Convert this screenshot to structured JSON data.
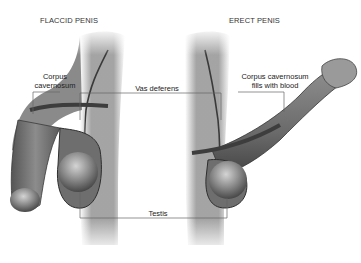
{
  "titles": {
    "left": "FLACCID PENIS",
    "right": "ERECT PENIS"
  },
  "labels": {
    "corpus_left_line1": "Corpus",
    "corpus_left_line2": "cavernosum",
    "vas_deferens": "Vas deferens",
    "corpus_right_line1": "Corpus cavernosum",
    "corpus_right_line2": "fills with blood",
    "testis": "Testis"
  },
  "colors": {
    "tissue": "#7a7a7a",
    "tissue_dark": "#4a4a4a",
    "body_fade": "#9a9a9a",
    "leader_line": "#666666",
    "text": "#222222"
  }
}
